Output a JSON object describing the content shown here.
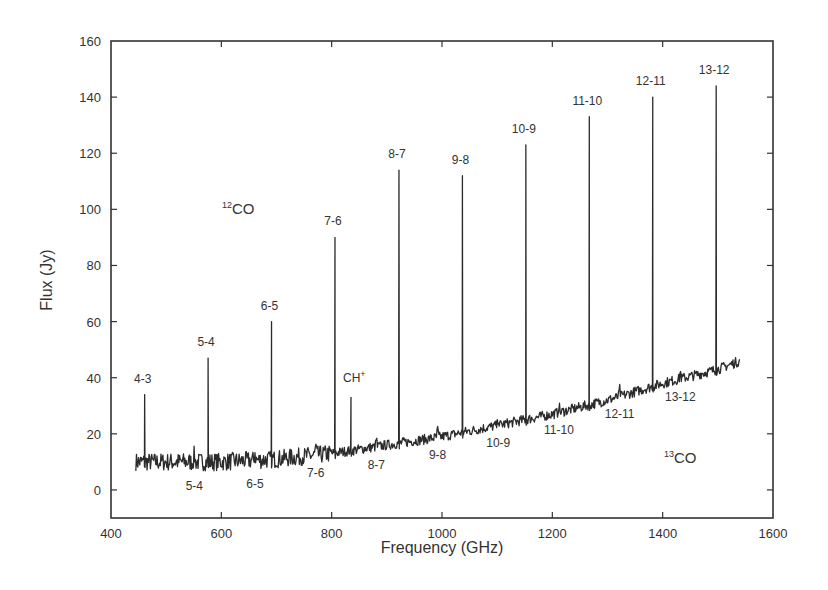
{
  "chart_data": {
    "type": "line",
    "title": "",
    "xlabel": "Frequency (GHz)",
    "ylabel": "Flux (Jy)",
    "xlim": [
      400,
      1600
    ],
    "ylim": [
      -10,
      160
    ],
    "xticks": [
      400,
      600,
      800,
      1000,
      1200,
      1400,
      1600
    ],
    "yticks": [
      0,
      20,
      40,
      60,
      80,
      100,
      120,
      140,
      160
    ],
    "grid": false,
    "legend": null,
    "continuum": {
      "x": [
        445,
        500,
        600,
        700,
        800,
        900,
        1000,
        1100,
        1200,
        1300,
        1400,
        1500,
        1540
      ],
      "y": [
        10,
        10,
        10,
        11,
        13,
        16,
        19,
        23,
        27,
        32,
        38,
        43,
        46
      ]
    },
    "series": [
      {
        "name": "12CO",
        "lines": [
          {
            "label": "4-3",
            "x": 461,
            "y": 34
          },
          {
            "label": "5-4",
            "x": 576,
            "y": 47
          },
          {
            "label": "6-5",
            "x": 691,
            "y": 60
          },
          {
            "label": "7-6",
            "x": 806,
            "y": 90
          },
          {
            "label": "8-7",
            "x": 922,
            "y": 114
          },
          {
            "label": "9-8",
            "x": 1037,
            "y": 112
          },
          {
            "label": "10-9",
            "x": 1152,
            "y": 123
          },
          {
            "label": "11-10",
            "x": 1267,
            "y": 133
          },
          {
            "label": "12-11",
            "x": 1382,
            "y": 140
          },
          {
            "label": "13-12",
            "x": 1497,
            "y": 144
          }
        ]
      },
      {
        "name": "13CO",
        "lines": [
          {
            "label": "5-4",
            "x": 551
          },
          {
            "label": "6-5",
            "x": 661
          },
          {
            "label": "7-6",
            "x": 771
          },
          {
            "label": "8-7",
            "x": 881
          },
          {
            "label": "9-8",
            "x": 992
          },
          {
            "label": "10-9",
            "x": 1102
          },
          {
            "label": "11-10",
            "x": 1212
          },
          {
            "label": "12-11",
            "x": 1322
          },
          {
            "label": "13-12",
            "x": 1432
          }
        ]
      },
      {
        "name": "CH+",
        "lines": [
          {
            "label": "CH+",
            "x": 835,
            "y": 33
          }
        ]
      }
    ],
    "annotations": [
      {
        "text": "12CO",
        "x": 620,
        "y": 100
      },
      {
        "text": "13CO",
        "x": 1480,
        "y": 0
      },
      {
        "text": "CH+",
        "x": 835,
        "y": 40
      }
    ]
  },
  "labels": {
    "xlabel": "Frequency (GHz)",
    "ylabel": "Flux (Jy)",
    "iso12_mass": "12",
    "iso12_mol": "CO",
    "iso13_mass": "13",
    "iso13_mol": "CO",
    "chplus_base": "CH",
    "chplus_sup": "+"
  }
}
